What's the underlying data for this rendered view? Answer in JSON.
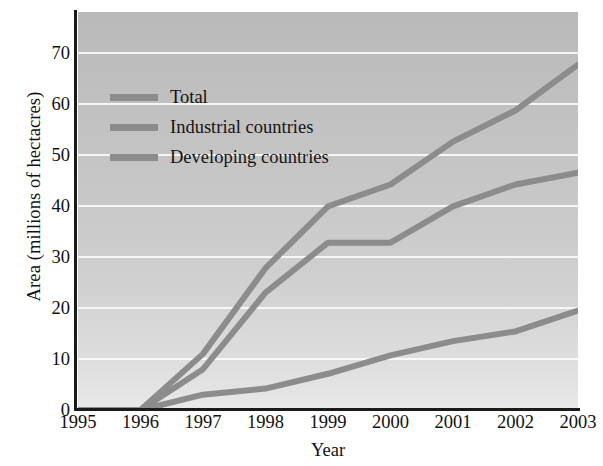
{
  "chart_data": {
    "type": "line",
    "title": "",
    "xlabel": "Year",
    "ylabel": "Area (millions of hectacres)",
    "x": [
      1995,
      1996,
      1997,
      1998,
      1999,
      2000,
      2001,
      2002,
      2003
    ],
    "xtick_labels": [
      "1995",
      "1996",
      "1997",
      "1998",
      "1999",
      "2000",
      "2001",
      "2002",
      "2003"
    ],
    "ytick_labels": [
      "0",
      "10",
      "20",
      "30",
      "40",
      "50",
      "60",
      "70"
    ],
    "yticks": [
      0,
      10,
      20,
      30,
      40,
      50,
      60,
      70
    ],
    "xlim": [
      1995,
      2003
    ],
    "ylim": [
      0,
      78
    ],
    "grid": true,
    "legend_position": "upper-left-inside",
    "series": [
      {
        "name": "Total",
        "color": "#8c8c8c",
        "values": [
          0,
          0,
          11.0,
          27.8,
          39.9,
          44.2,
          52.6,
          58.7,
          67.7
        ]
      },
      {
        "name": "Industrial countries",
        "color": "#8c8c8c",
        "values": [
          0,
          0,
          8.0,
          23.0,
          32.8,
          32.8,
          39.9,
          44.2,
          46.5
        ]
      },
      {
        "name": "Developing countries",
        "color": "#8c8c8c",
        "values": [
          0,
          0,
          3.0,
          4.2,
          7.1,
          10.7,
          13.5,
          15.4,
          19.5
        ]
      }
    ]
  },
  "colors": {
    "line": "#8c8c8c",
    "axis": "#1a1a1a",
    "gridline": "#fafafa",
    "text": "#111111",
    "plot_background_top": "#b9b9b9",
    "plot_background_bottom": "#e8e8e8"
  }
}
